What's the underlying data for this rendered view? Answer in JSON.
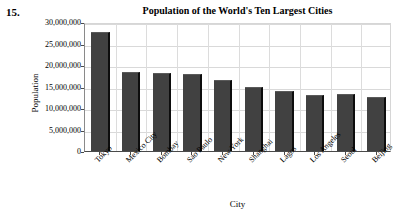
{
  "problem": {
    "number": "15."
  },
  "chart_data": {
    "type": "bar",
    "title": "Population of the World's Ten Largest Cities",
    "xlabel": "City",
    "ylabel": "Population",
    "categories": [
      "Tokyo",
      "Mexico City",
      "Bombay",
      "Sao Paulo",
      "New York",
      "Shanghai",
      "Lagos",
      "Los Angeles",
      "Seoul",
      "Beijing"
    ],
    "values": [
      27700000,
      18400000,
      18100000,
      17800000,
      16600000,
      14900000,
      13900000,
      13100000,
      13200000,
      12600000
    ],
    "ylim": [
      0,
      30000000
    ],
    "ytick_values": [
      0,
      5000000,
      10000000,
      15000000,
      20000000,
      25000000,
      30000000
    ],
    "ytick_labels": [
      "0",
      "5,000,000",
      "10,000,000",
      "15,000,000",
      "20,000,000",
      "25,000,000",
      "30,000,000"
    ],
    "grid": true,
    "legend": false,
    "bar_color": "#414141",
    "grid_color": "#d9d9d9",
    "axis_color": "#4a4a4a",
    "background": "#ffffff"
  }
}
